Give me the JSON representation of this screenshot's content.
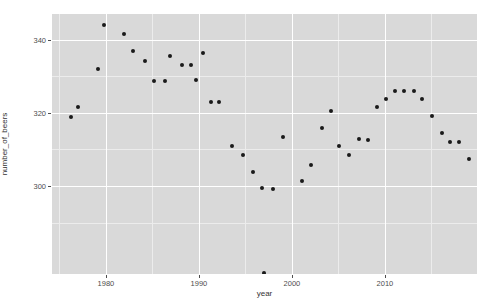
{
  "chart_data": {
    "type": "scatter",
    "title": "",
    "xlabel": "year",
    "ylabel": "number_of_beers",
    "xlim": [
      1974.2,
      2019.9
    ],
    "ylim": [
      276.0,
      347.0
    ],
    "x_ticks": [
      1980,
      1990,
      2000,
      2010
    ],
    "x_tick_labels": [
      "1980",
      "1990",
      "2000",
      "2010"
    ],
    "y_ticks": [
      300,
      320,
      340
    ],
    "y_tick_labels": [
      "300",
      "320",
      "340"
    ],
    "y_minor_ticks": [
      290,
      310,
      330
    ],
    "x_minor_ticks": [
      1975,
      1985,
      1995,
      2005,
      2015
    ],
    "grid": true,
    "legend": "none",
    "panel_background": "#d9d9d9",
    "grid_major_color": "#ffffff",
    "grid_minor_color": "#ececec",
    "point_color": "#1a1a1a",
    "points": [
      {
        "x": 1976.2,
        "y": 319.0
      },
      {
        "x": 1977.0,
        "y": 321.6
      },
      {
        "x": 1979.1,
        "y": 332.1
      },
      {
        "x": 1979.8,
        "y": 343.9
      },
      {
        "x": 1981.9,
        "y": 341.5
      },
      {
        "x": 1982.9,
        "y": 337.0
      },
      {
        "x": 1984.2,
        "y": 334.3
      },
      {
        "x": 1985.2,
        "y": 328.7
      },
      {
        "x": 1986.3,
        "y": 328.7
      },
      {
        "x": 1986.9,
        "y": 335.4
      },
      {
        "x": 1988.2,
        "y": 333.0
      },
      {
        "x": 1989.2,
        "y": 333.2
      },
      {
        "x": 1989.7,
        "y": 328.9
      },
      {
        "x": 1990.4,
        "y": 336.3
      },
      {
        "x": 1991.3,
        "y": 323.1
      },
      {
        "x": 1992.2,
        "y": 322.9
      },
      {
        "x": 1993.6,
        "y": 310.9
      },
      {
        "x": 1994.7,
        "y": 308.6
      },
      {
        "x": 1995.8,
        "y": 303.9
      },
      {
        "x": 1996.8,
        "y": 299.4
      },
      {
        "x": 1998.0,
        "y": 299.3
      },
      {
        "x": 1997.0,
        "y": 276.3
      },
      {
        "x": 1999.0,
        "y": 313.3
      },
      {
        "x": 2001.1,
        "y": 301.4
      },
      {
        "x": 2002.1,
        "y": 305.9
      },
      {
        "x": 2003.2,
        "y": 316.0
      },
      {
        "x": 2004.2,
        "y": 320.6
      },
      {
        "x": 2005.1,
        "y": 310.9
      },
      {
        "x": 2006.1,
        "y": 308.6
      },
      {
        "x": 2007.2,
        "y": 312.8
      },
      {
        "x": 2008.2,
        "y": 312.7
      },
      {
        "x": 2009.1,
        "y": 321.5
      },
      {
        "x": 2010.1,
        "y": 323.7
      },
      {
        "x": 2011.1,
        "y": 326.1
      },
      {
        "x": 2012.1,
        "y": 326.1
      },
      {
        "x": 2013.1,
        "y": 326.1
      },
      {
        "x": 2014.0,
        "y": 323.9
      },
      {
        "x": 2015.1,
        "y": 319.1
      },
      {
        "x": 2016.1,
        "y": 314.5
      },
      {
        "x": 2017.0,
        "y": 312.1
      },
      {
        "x": 2018.0,
        "y": 312.1
      },
      {
        "x": 2019.0,
        "y": 307.5
      }
    ]
  }
}
